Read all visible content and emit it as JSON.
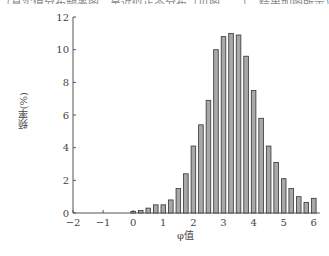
{
  "header_text": "（真实值分布频率图，呈近似正态分布（见图……），结果如图所示）",
  "chart_data": {
    "type": "bar",
    "title": "",
    "xlabel": "φ值",
    "ylabel": "频率(%)",
    "xlim": [
      -2,
      6.2
    ],
    "ylim": [
      0,
      12
    ],
    "xticks": [
      -2,
      -1,
      0,
      1,
      2,
      3,
      4,
      5,
      6
    ],
    "yticks": [
      0,
      2,
      4,
      6,
      8,
      10,
      12
    ],
    "grid": false,
    "legend": null,
    "bar_color": "#a8a8a8",
    "bar_edge_color": "#333333",
    "x": [
      0,
      0.25,
      0.5,
      0.75,
      1.0,
      1.25,
      1.5,
      1.75,
      2.0,
      2.25,
      2.5,
      2.75,
      3.0,
      3.25,
      3.5,
      3.75,
      4.0,
      4.25,
      4.5,
      4.75,
      5.0,
      5.25,
      5.5,
      5.75,
      6.0
    ],
    "values": [
      0.1,
      0.15,
      0.3,
      0.5,
      0.5,
      0.8,
      1.5,
      2.4,
      4.1,
      5.4,
      6.9,
      10.0,
      10.8,
      11.0,
      10.9,
      9.6,
      7.5,
      5.8,
      4.1,
      3.1,
      2.1,
      1.5,
      1.0,
      0.65,
      0.9
    ]
  }
}
